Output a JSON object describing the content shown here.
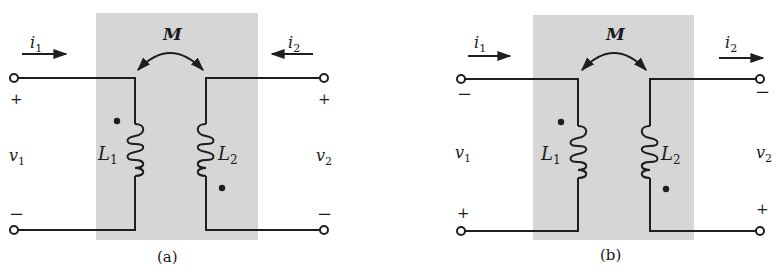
{
  "colors": {
    "shade": "#d6d6d6",
    "wire": "#1e1e1e",
    "background": "#ffffff"
  },
  "panels": [
    {
      "id": "a",
      "caption": "(a)",
      "mutual_label": "M",
      "current_left": {
        "label": "i",
        "sub": "1",
        "direction": "right"
      },
      "current_right": {
        "label": "i",
        "sub": "2",
        "direction": "left"
      },
      "voltage_left": {
        "label": "v",
        "sub": "1",
        "top_sign": "+",
        "bottom_sign": "−"
      },
      "voltage_right": {
        "label": "v",
        "sub": "2",
        "top_sign": "+",
        "bottom_sign": "−"
      },
      "inductor_left": {
        "label": "L",
        "sub": "1",
        "dot": "top"
      },
      "inductor_right": {
        "label": "L",
        "sub": "2",
        "dot": "bottom"
      }
    },
    {
      "id": "b",
      "caption": "(b)",
      "mutual_label": "M",
      "current_left": {
        "label": "i",
        "sub": "1",
        "direction": "right"
      },
      "current_right": {
        "label": "i",
        "sub": "2",
        "direction": "right"
      },
      "voltage_left": {
        "label": "v",
        "sub": "1",
        "top_sign": "−",
        "bottom_sign": "+"
      },
      "voltage_right": {
        "label": "v",
        "sub": "2",
        "top_sign": "−",
        "bottom_sign": "+"
      },
      "inductor_left": {
        "label": "L",
        "sub": "1",
        "dot": "top"
      },
      "inductor_right": {
        "label": "L",
        "sub": "2",
        "dot": "bottom"
      }
    }
  ]
}
